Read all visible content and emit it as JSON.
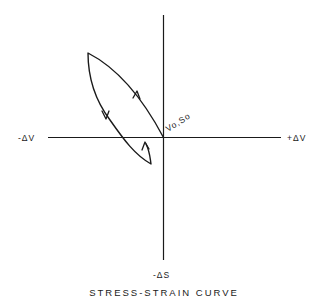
{
  "diagram": {
    "caption": "STRESS-STRAIN CURVE",
    "axes": {
      "x_negative_label": "-ΔV",
      "x_positive_label": "+ΔV",
      "y_negative_label": "-ΔS"
    },
    "origin_label": "Vo,So",
    "loop": {
      "description": "Closed hysteresis-like loop in the upper-left quadrant, passing through origin (Vo,So) and dipping slightly below the -ΔV axis",
      "direction_arrows": [
        {
          "segment": "upper branch toward top-left",
          "direction": "up"
        },
        {
          "segment": "left branch from top-left",
          "direction": "down"
        },
        {
          "segment": "return hook below axis",
          "direction": "up"
        }
      ]
    }
  }
}
